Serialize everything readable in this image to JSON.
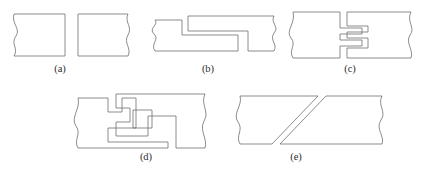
{
  "figure": {
    "stroke_color": "#6f6f72",
    "caption_color": "#2e2e30",
    "background_color": "#ffffff",
    "width": 426,
    "height": 172
  },
  "panels": [
    {
      "id": "a",
      "caption": "(a)",
      "joint_name": "butt-joint",
      "description": "Two separate square-ended members shown end to end with wavy break lines on the outer edges",
      "caption_x": 60,
      "caption_y": 72,
      "shapes": [
        {
          "name": "left-member",
          "path": "M 14 14 L 65 14 L 65 56 L 14 56 C 19 48 10 44 16 36 C 21 29 11 23 14 14 Z"
        },
        {
          "name": "right-member",
          "path": "M 78 14 L 128 14 C 124 22 133 27 128 35 C 123 43 132 48 128 56 L 78 56 Z"
        }
      ]
    },
    {
      "id": "b",
      "caption": "(b)",
      "joint_name": "lap-joint",
      "description": "Half-lap joint: upper tongue of the left member overlaps the lower tongue of the right member",
      "caption_x": 208,
      "caption_y": 72,
      "shapes": [
        {
          "name": "left-member-lap",
          "path": "M 155 20 L 182 20 L 182 35 L 238 35 L 238 51 L 155 51 C 150 44 160 39 154 34 C 148 28 159 25 155 20 Z"
        },
        {
          "name": "right-member-lap",
          "path": "M 188 16 L 274 16 C 270 23 280 27 274 33 C 269 40 278 44 274 51 L 248 51 L 248 31 L 188 31 Z"
        }
      ]
    },
    {
      "id": "c",
      "caption": "(c)",
      "joint_name": "finger-joint",
      "description": "Interlocking stepped finger or comb joint with rectangular tabs engaging at mid height",
      "caption_x": 350,
      "caption_y": 72,
      "shapes": [
        {
          "name": "left-member-finger",
          "path": "M 293 12 L 340 12 L 340 28 L 362 28 L 362 34 L 340 34 L 340 40 L 362 40 L 362 46 L 340 46 L 340 58 L 293 58 C 288 50 297 45 291 38 C 285 31 296 23 293 12 Z"
        },
        {
          "name": "right-member-finger",
          "path": "M 347 12 L 411 12 C 406 22 416 28 410 35 C 405 43 414 50 411 58 L 347 58 L 347 48 L 368 48 L 368 38 L 347 38 L 347 32 L 368 32 L 368 26 L 347 26 Z"
        }
      ]
    },
    {
      "id": "d",
      "caption": "(d)",
      "joint_name": "keyed-interlocking-joint",
      "description": "Complex stepped interlocking joint with a small square locking key near the centre",
      "caption_x": 146,
      "caption_y": 160,
      "shapes": [
        {
          "name": "left-member-keyed",
          "path": "M 78 98 L 108 98 L 108 112 L 122 112 L 122 98 L 136 98 L 136 128 L 108 128 L 108 142 L 168 142 L 168 148 L 78 148 C 73 140 82 134 76 126 C 70 118 81 108 78 98 Z"
        },
        {
          "name": "right-member-keyed",
          "path": "M 116 94 L 205 94 C 200 104 210 112 204 121 C 199 131 208 139 205 148 L 176 148 L 176 116 L 148 116 L 148 136 L 116 136 L 116 122 L 130 122 L 130 108 L 116 108 Z"
        },
        {
          "name": "square-key",
          "path": "M 133 110 L 152 110 L 152 128 L 133 128 Z"
        }
      ]
    },
    {
      "id": "e",
      "caption": "(e)",
      "joint_name": "scarf-joint",
      "description": "Scarf or angled splice joint formed by two parallel diagonal cut lines",
      "caption_x": 296,
      "caption_y": 160,
      "shapes": [
        {
          "name": "left-member-scarf",
          "path": "M 240 96 L 318 96 L 272 144 L 240 144 C 235 136 244 130 238 122 C 232 114 243 105 240 96 Z"
        },
        {
          "name": "right-member-scarf",
          "path": "M 326 96 L 382 96 C 377 105 387 112 381 120 C 375 129 385 136 382 144 L 280 144 Z"
        }
      ]
    }
  ]
}
